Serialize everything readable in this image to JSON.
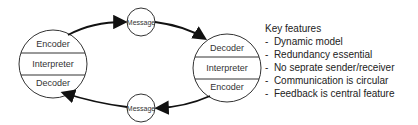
{
  "left_node": {
    "top": "Encoder",
    "middle": "Interpreter",
    "bottom": "Decoder"
  },
  "right_node": {
    "top": "Decoder",
    "middle": "Interpreter",
    "bottom": "Encoder"
  },
  "messages": {
    "top": "Message",
    "bottom": "Message"
  },
  "key_features": {
    "title": "Key features",
    "items": [
      "Dynamic model",
      "Redundancy essential",
      "No seprate sender/receiver",
      "Communication is circular",
      "Feedback is central feature"
    ]
  }
}
